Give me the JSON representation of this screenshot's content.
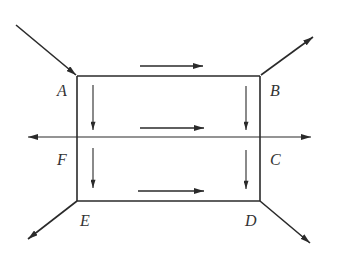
{
  "diagram": {
    "type": "flow-network",
    "nodes": [
      {
        "id": "A",
        "label": "A"
      },
      {
        "id": "B",
        "label": "B"
      },
      {
        "id": "C",
        "label": "C"
      },
      {
        "id": "D",
        "label": "D"
      },
      {
        "id": "E",
        "label": "E"
      },
      {
        "id": "F",
        "label": "F"
      }
    ],
    "edges": [
      {
        "from": "A",
        "to": "B",
        "direction": "right"
      },
      {
        "from": "F",
        "to": "C",
        "direction": "right"
      },
      {
        "from": "E",
        "to": "D",
        "direction": "right"
      },
      {
        "from": "A",
        "to": "F",
        "direction": "down"
      },
      {
        "from": "F",
        "to": "E",
        "direction": "down"
      },
      {
        "from": "B",
        "to": "C",
        "direction": "down"
      },
      {
        "from": "C",
        "to": "D",
        "direction": "down"
      }
    ],
    "external_arrows": [
      {
        "at": "A",
        "direction": "inflow"
      },
      {
        "at": "B",
        "direction": "outflow"
      },
      {
        "at": "F",
        "direction": "outflow-left"
      },
      {
        "at": "C",
        "direction": "outflow-right"
      },
      {
        "at": "E",
        "direction": "outflow"
      },
      {
        "at": "D",
        "direction": "outflow"
      }
    ]
  }
}
